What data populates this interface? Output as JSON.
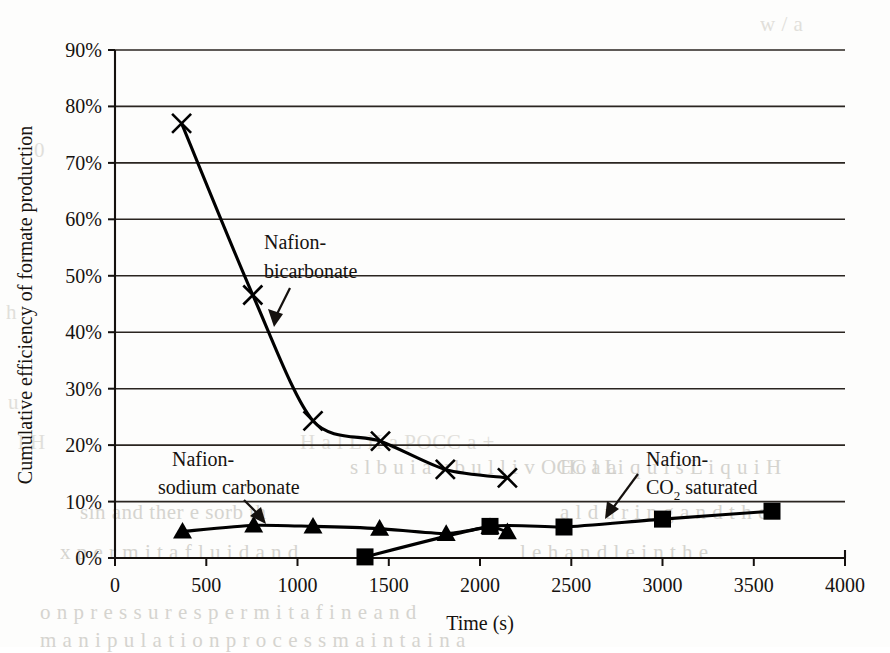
{
  "chart_data": {
    "type": "line",
    "title": "",
    "xlabel": "Time (s)",
    "ylabel": "Cumulative efficiency of formate production",
    "xlim": [
      0,
      4000
    ],
    "ylim": [
      0,
      0.9
    ],
    "xticks": [
      0,
      500,
      1000,
      1500,
      2000,
      2500,
      3000,
      3500,
      4000
    ],
    "xticklabels": [
      "0",
      "500",
      "1000",
      "1500",
      "2000",
      "2500",
      "3000",
      "3500",
      "4000"
    ],
    "yticks": [
      0,
      0.1,
      0.2,
      0.3,
      0.4,
      0.5,
      0.6,
      0.7,
      0.8,
      0.9
    ],
    "yticklabels": [
      "0%",
      "10%",
      "20%",
      "30%",
      "40%",
      "50%",
      "60%",
      "70%",
      "80%",
      "90%"
    ],
    "grid": "horizontal",
    "legend": "none-annotated",
    "series": [
      {
        "name": "Nafion-bicarbonate",
        "marker": "x",
        "color": "#000000",
        "points": [
          {
            "x": 365,
            "y": 0.77
          },
          {
            "x": 755,
            "y": 0.466
          },
          {
            "x": 1085,
            "y": 0.243
          },
          {
            "x": 1455,
            "y": 0.207
          },
          {
            "x": 1810,
            "y": 0.157
          },
          {
            "x": 2150,
            "y": 0.142
          }
        ]
      },
      {
        "name": "Nafion-sodium carbonate",
        "marker": "triangle",
        "color": "#000000",
        "points": [
          {
            "x": 370,
            "y": 0.047
          },
          {
            "x": 760,
            "y": 0.058
          },
          {
            "x": 1085,
            "y": 0.056
          },
          {
            "x": 1450,
            "y": 0.052
          },
          {
            "x": 1815,
            "y": 0.043
          },
          {
            "x": 2055,
            "y": 0.055
          },
          {
            "x": 2150,
            "y": 0.046
          }
        ]
      },
      {
        "name": "Nafion-CO2 saturated",
        "marker": "square",
        "color": "#000000",
        "points": [
          {
            "x": 1370,
            "y": 0.002
          },
          {
            "x": 2055,
            "y": 0.056
          },
          {
            "x": 2460,
            "y": 0.055
          },
          {
            "x": 3000,
            "y": 0.069
          },
          {
            "x": 3600,
            "y": 0.083
          }
        ]
      }
    ],
    "annotations": [
      {
        "id": "anno-bicarbonate",
        "lines": [
          "Nafion-",
          "bicarbonate"
        ],
        "target_x": 900,
        "target_y": 0.35
      },
      {
        "id": "anno-sodium-carbonate",
        "lines": [
          "Nafion-",
          "sodium carbonate"
        ],
        "target_x": 760,
        "target_y": 0.058
      },
      {
        "id": "anno-co2-saturated",
        "lines": [
          "Nafion-",
          "CO2 saturated"
        ],
        "line2_prefix": "CO",
        "line2_sub": "2",
        "line2_suffix": " saturated",
        "target_x": 2870,
        "target_y": 0.062
      }
    ]
  },
  "page_showthrough": [
    {
      "text": "w / a",
      "x": 760,
      "y": 12,
      "light": true
    },
    {
      "text": "0",
      "x": 34,
      "y": 138,
      "light": true
    },
    {
      "text": "h",
      "x": 6,
      "y": 300,
      "light": true
    },
    {
      "text": "u",
      "x": 8,
      "y": 390,
      "light": true
    },
    {
      "text": "l  H",
      "x": 18,
      "y": 430,
      "light": true
    },
    {
      "text": "s  l  b u i   a   v   b u l   l   i   v OCC a a",
      "x": 350,
      "y": 455,
      "light": false
    },
    {
      "text": "H a  l  L H  a   POCC a +",
      "x": 300,
      "y": 430,
      "light": true
    },
    {
      "text": "Ho  l  Li q u i   s     L i q u i   H",
      "x": 560,
      "y": 455,
      "light": false
    },
    {
      "text": "sin  and  ther e  sorb   th",
      "x": 80,
      "y": 500,
      "light": false
    },
    {
      "text": "a  l  d u   r i n g   a n d   t h e",
      "x": 560,
      "y": 500,
      "light": false
    },
    {
      "text": "x  p e r m i t   a   f l u i d  a n d",
      "x": 60,
      "y": 540,
      "light": false
    },
    {
      "text": "l e  h a n d l e   i n  t h e",
      "x": 520,
      "y": 540,
      "light": false
    },
    {
      "text": "o  n    p r e  s s  u r e s    p e r m i t   a   f i n e  a n d",
      "x": 40,
      "y": 600,
      "light": false
    },
    {
      "text": "m a  n  i  p u  l a  t i o n   p r o c e s s   m a  i n t a i n   a",
      "x": 40,
      "y": 628,
      "light": false
    }
  ]
}
